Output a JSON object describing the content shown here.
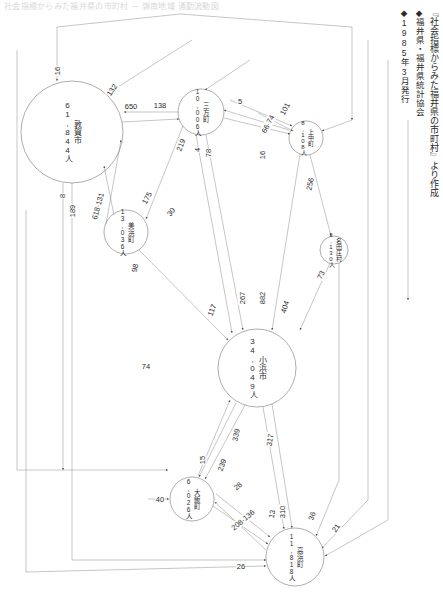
{
  "page": {
    "top_title": "社会指標からみた福井県の市町村 － 嶺南地域 通勤流動図",
    "caption_line1": "『社会指標からみた福井県の市町村』より作成",
    "caption_line2": "◆福井県・福井県統計協会",
    "caption_line3": "◆1985年3月発行"
  },
  "chart_data": {
    "type": "diagram",
    "title": "社会指標からみた福井県の市町村 － 嶺南地域 通勤流動図",
    "subtitle": "『社会指標からみた福井県の市町村』より作成",
    "source": "◆福井県・福井県統計協会 ◆1985年3月発行",
    "nodes": [
      {
        "id": "tsuruga",
        "name": "敦賀市",
        "population": "61,844人",
        "cx": 72,
        "cy": 132,
        "r": 51
      },
      {
        "id": "mikata",
        "name": "三方町",
        "population": "10,006人",
        "cx": 201,
        "cy": 112,
        "r": 23
      },
      {
        "id": "kaminaka",
        "name": "上中町",
        "population": "8,108人",
        "cx": 306,
        "cy": 138,
        "r": 17
      },
      {
        "id": "mihama",
        "name": "美浜町",
        "population": "13,036人",
        "cx": 126,
        "cy": 232,
        "r": 22
      },
      {
        "id": "natasho",
        "name": "名田庄村",
        "population": "3,130人",
        "cx": 334,
        "cy": 250,
        "r": 14
      },
      {
        "id": "obama",
        "name": "小浜市",
        "population": "34,049人",
        "cx": 257,
        "cy": 368,
        "r": 39
      },
      {
        "id": "ooi",
        "name": "大飯町",
        "population": "6,026人",
        "cx": 192,
        "cy": 499,
        "r": 22
      },
      {
        "id": "takahama",
        "name": "高浜町",
        "population": "11,818人",
        "cx": 295,
        "cy": 557,
        "r": 29
      }
    ],
    "edges": [
      {
        "value": "16",
        "label_x": 57,
        "label_y": 71,
        "rot": -90
      },
      {
        "value": "132",
        "label_x": 112,
        "label_y": 90,
        "rot": -55
      },
      {
        "value": "650",
        "label_x": 131,
        "label_y": 106,
        "rot": 0
      },
      {
        "value": "138",
        "label_x": 160,
        "label_y": 105,
        "rot": 0
      },
      {
        "value": "5",
        "label_x": 240,
        "label_y": 101,
        "rot": 0
      },
      {
        "value": "101",
        "label_x": 285,
        "label_y": 109,
        "rot": -62
      },
      {
        "value": "66·74",
        "label_x": 268,
        "label_y": 124,
        "rot": -62
      },
      {
        "value": "219",
        "label_x": 181,
        "label_y": 145,
        "rot": -68
      },
      {
        "value": "4",
        "label_x": 197,
        "label_y": 150,
        "rot": -90
      },
      {
        "value": "78",
        "label_x": 208,
        "label_y": 153,
        "rot": -90
      },
      {
        "value": "16",
        "label_x": 262,
        "label_y": 155,
        "rot": -90
      },
      {
        "value": "256",
        "label_x": 310,
        "label_y": 184,
        "rot": -78
      },
      {
        "value": "175",
        "label_x": 147,
        "label_y": 198,
        "rot": -62
      },
      {
        "value": "30",
        "label_x": 171,
        "label_y": 212,
        "rot": -52
      },
      {
        "value": "8",
        "label_x": 62,
        "label_y": 196,
        "rot": -90
      },
      {
        "value": "189",
        "label_x": 72,
        "label_y": 211,
        "rot": -90
      },
      {
        "value": "618·131",
        "label_x": 98,
        "label_y": 206,
        "rot": -75
      },
      {
        "value": "98",
        "label_x": 135,
        "label_y": 268,
        "rot": -78
      },
      {
        "value": "73",
        "label_x": 321,
        "label_y": 275,
        "rot": -64
      },
      {
        "value": "117",
        "label_x": 212,
        "label_y": 310,
        "rot": -70
      },
      {
        "value": "267",
        "label_x": 242,
        "label_y": 298,
        "rot": -90
      },
      {
        "value": "882",
        "label_x": 262,
        "label_y": 298,
        "rot": -90
      },
      {
        "value": "404",
        "label_x": 285,
        "label_y": 307,
        "rot": -72
      },
      {
        "value": "74",
        "label_x": 146,
        "label_y": 366,
        "rot": 0
      },
      {
        "value": "339",
        "label_x": 236,
        "label_y": 435,
        "rot": -78
      },
      {
        "value": "317",
        "label_x": 270,
        "label_y": 440,
        "rot": -80
      },
      {
        "value": "15",
        "label_x": 202,
        "label_y": 460,
        "rot": -90
      },
      {
        "value": "239",
        "label_x": 222,
        "label_y": 465,
        "rot": -70
      },
      {
        "value": "28",
        "label_x": 238,
        "label_y": 486,
        "rot": -40
      },
      {
        "value": "40",
        "label_x": 160,
        "label_y": 499,
        "rot": 0
      },
      {
        "value": "208·136",
        "label_x": 243,
        "label_y": 520,
        "rot": -40
      },
      {
        "value": "13",
        "label_x": 272,
        "label_y": 514,
        "rot": -80
      },
      {
        "value": "310",
        "label_x": 282,
        "label_y": 512,
        "rot": -90
      },
      {
        "value": "36",
        "label_x": 312,
        "label_y": 516,
        "rot": -72
      },
      {
        "value": "21",
        "label_x": 336,
        "label_y": 528,
        "rot": -55
      },
      {
        "value": "26",
        "label_x": 241,
        "label_y": 566,
        "rot": 0
      }
    ]
  }
}
